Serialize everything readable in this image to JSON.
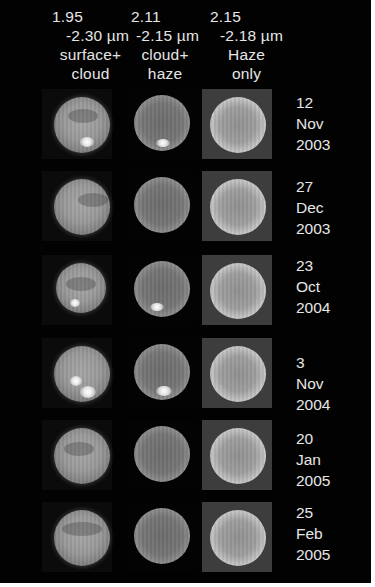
{
  "figure": {
    "columns": [
      {
        "wavelength_start": "1.95",
        "wavelength_end": "-2.30 µm",
        "label_line1": "surface+",
        "label_line2": "cloud"
      },
      {
        "wavelength_start": "2.11",
        "wavelength_end": "-2.15 µm",
        "label_line1": "cloud+",
        "label_line2": "haze"
      },
      {
        "wavelength_start": "2.15",
        "wavelength_end": "-2.18 µm",
        "label_line1": "Haze",
        "label_line2": "only"
      }
    ],
    "rows": [
      {
        "day": "12",
        "month": "Nov",
        "year": "2003"
      },
      {
        "day": "27",
        "month": "Dec",
        "year": "2003"
      },
      {
        "day": "23",
        "month": "Oct",
        "year": "2004"
      },
      {
        "day": "3",
        "month": "Nov",
        "year": "2004"
      },
      {
        "day": "20",
        "month": "Jan",
        "year": "2005"
      },
      {
        "day": "25",
        "month": "Feb",
        "year": "2005"
      }
    ]
  }
}
